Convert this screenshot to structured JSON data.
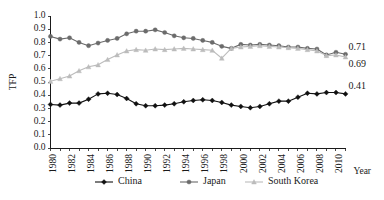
{
  "chart_data": {
    "type": "line",
    "title": "",
    "xlabel": "Year",
    "ylabel": "TFP",
    "ylim": [
      0.0,
      1.0
    ],
    "xlim": [
      1980,
      2011
    ],
    "grid": false,
    "legend_position": "bottom",
    "ytick_labels": [
      "0.0",
      "0.1",
      "0.2",
      "0.3",
      "0.4",
      "0.5",
      "0.6",
      "0.7",
      "0.8",
      "0.9",
      "1.0"
    ],
    "ytick_values": [
      0.0,
      0.1,
      0.2,
      0.3,
      0.4,
      0.5,
      0.6,
      0.7,
      0.8,
      0.9,
      1.0
    ],
    "xtick_labels": [
      "1980",
      "1982",
      "1984",
      "1986",
      "1988",
      "1990",
      "1992",
      "1994",
      "1996",
      "1998",
      "2000",
      "2002",
      "2004",
      "2006",
      "2008",
      "2010"
    ],
    "xtick_values": [
      1980,
      1982,
      1984,
      1986,
      1988,
      1990,
      1992,
      1994,
      1996,
      1998,
      2000,
      2002,
      2004,
      2006,
      2008,
      2010
    ],
    "x": [
      1980,
      1981,
      1982,
      1983,
      1984,
      1985,
      1986,
      1987,
      1988,
      1989,
      1990,
      1991,
      1992,
      1993,
      1994,
      1995,
      1996,
      1997,
      1998,
      1999,
      2000,
      2001,
      2002,
      2003,
      2004,
      2005,
      2006,
      2007,
      2008,
      2009,
      2010,
      2011
    ],
    "series": [
      {
        "name": "China",
        "color": "#111111",
        "marker": "diamond",
        "values": [
          0.33,
          0.325,
          0.34,
          0.34,
          0.37,
          0.41,
          0.415,
          0.405,
          0.375,
          0.335,
          0.32,
          0.32,
          0.325,
          0.335,
          0.35,
          0.36,
          0.365,
          0.36,
          0.345,
          0.325,
          0.315,
          0.305,
          0.315,
          0.335,
          0.355,
          0.355,
          0.385,
          0.415,
          0.41,
          0.42,
          0.42,
          0.41
        ],
        "end_label": "0.41"
      },
      {
        "name": "Japan",
        "color": "#6b6b6b",
        "marker": "circle",
        "values": [
          0.845,
          0.825,
          0.835,
          0.8,
          0.775,
          0.795,
          0.815,
          0.83,
          0.865,
          0.885,
          0.885,
          0.895,
          0.875,
          0.85,
          0.835,
          0.83,
          0.815,
          0.8,
          0.77,
          0.755,
          0.785,
          0.78,
          0.785,
          0.78,
          0.775,
          0.765,
          0.765,
          0.755,
          0.75,
          0.705,
          0.725,
          0.71
        ],
        "end_label": "0.71"
      },
      {
        "name": "South Korea",
        "color": "#bcbcbc",
        "marker": "triangle",
        "values": [
          0.505,
          0.525,
          0.545,
          0.585,
          0.615,
          0.63,
          0.67,
          0.705,
          0.735,
          0.745,
          0.74,
          0.75,
          0.745,
          0.75,
          0.755,
          0.75,
          0.745,
          0.74,
          0.68,
          0.755,
          0.765,
          0.77,
          0.775,
          0.77,
          0.765,
          0.76,
          0.755,
          0.745,
          0.735,
          0.7,
          0.705,
          0.69
        ],
        "end_label": "0.69"
      }
    ]
  },
  "legend": {
    "items": [
      {
        "label": "China"
      },
      {
        "label": "Japan"
      },
      {
        "label": "South Korea"
      }
    ]
  }
}
